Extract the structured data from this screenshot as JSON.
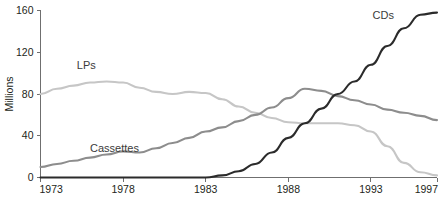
{
  "chart_data": {
    "type": "line",
    "title": "",
    "subtitle": "",
    "xlabel": "",
    "ylabel": "Millions",
    "xlim": [
      1973,
      1997
    ],
    "ylim": [
      0,
      160
    ],
    "grid": false,
    "legend_position": "inline-labels",
    "x_ticks": [
      "1973",
      "1978",
      "1983",
      "1988",
      "1993",
      "1997"
    ],
    "x_tick_values": [
      1973,
      1978,
      1983,
      1988,
      1993,
      1997
    ],
    "y_ticks": [
      "0",
      "40",
      "80",
      "120",
      "160"
    ],
    "y_tick_values": [
      0,
      40,
      80,
      120,
      160
    ],
    "x": [
      1973,
      1974,
      1975,
      1976,
      1977,
      1978,
      1979,
      1980,
      1981,
      1982,
      1983,
      1984,
      1985,
      1986,
      1987,
      1988,
      1989,
      1990,
      1991,
      1992,
      1993,
      1994,
      1995,
      1996,
      1997
    ],
    "series": [
      {
        "name": "LPs",
        "color": "#c6c6c6",
        "label_x": 1975.2,
        "label_y": 104,
        "values": [
          80,
          85,
          88,
          91,
          92,
          91,
          86,
          82,
          80,
          82,
          81,
          75,
          68,
          62,
          57,
          53,
          52,
          52,
          52,
          50,
          44,
          30,
          14,
          5,
          2
        ]
      },
      {
        "name": "Cassettes",
        "color": "#8d8d8d",
        "label_x": 1976.0,
        "label_y": 24,
        "values": [
          10,
          13,
          16,
          19,
          22,
          25,
          24,
          28,
          33,
          38,
          44,
          48,
          54,
          60,
          67,
          76,
          85,
          83,
          78,
          74,
          70,
          65,
          62,
          59,
          55
        ]
      },
      {
        "name": "CDs",
        "color": "#2b2b2b",
        "label_x": 1993.1,
        "label_y": 152,
        "values": [
          0,
          0,
          0,
          0,
          0,
          0,
          0,
          0,
          0,
          0,
          0,
          2,
          6,
          13,
          24,
          38,
          52,
          66,
          80,
          92,
          108,
          126,
          143,
          156,
          158
        ]
      }
    ]
  }
}
